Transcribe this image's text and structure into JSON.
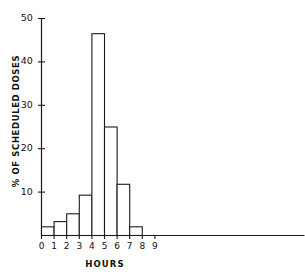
{
  "chart_data": {
    "type": "bar",
    "title": "",
    "subtitle": "",
    "xlabel": "HOURS",
    "ylabel": "% OF SCHEDULED DOSES",
    "categories": [
      "0",
      "1",
      "2",
      "3",
      "4",
      "5",
      "6",
      "7"
    ],
    "values": [
      2.0,
      3.2,
      5.0,
      9.3,
      46.5,
      25.0,
      11.8,
      2.0
    ],
    "bin_edges": [
      0,
      1,
      2,
      3,
      4,
      5,
      6,
      7,
      8
    ],
    "xlim": [
      0,
      9
    ],
    "ylim": [
      0,
      50
    ],
    "xticks": [
      "0",
      "1",
      "2",
      "3",
      "4",
      "5",
      "6",
      "7",
      "8",
      "9"
    ],
    "yticks": [
      "10",
      "20",
      "30",
      "40",
      "50"
    ],
    "grid": false,
    "legend": null,
    "bar_fill_color": "#ffffff",
    "bar_edge_color": "#1a1a1a",
    "axis_color": "#1a1a1a",
    "background_color": "#ffffff"
  },
  "axes": {
    "y": {
      "label": "% OF SCHEDULED DOSES",
      "ticks": [
        {
          "value": "50"
        },
        {
          "value": "40"
        },
        {
          "value": "30"
        },
        {
          "value": "20"
        },
        {
          "value": "10"
        }
      ]
    },
    "x": {
      "label": "HOURS",
      "ticks": [
        {
          "value": "0"
        },
        {
          "value": "1"
        },
        {
          "value": "2"
        },
        {
          "value": "3"
        },
        {
          "value": "4"
        },
        {
          "value": "5"
        },
        {
          "value": "6"
        },
        {
          "value": "7"
        },
        {
          "value": "8"
        },
        {
          "value": "9"
        }
      ]
    }
  }
}
